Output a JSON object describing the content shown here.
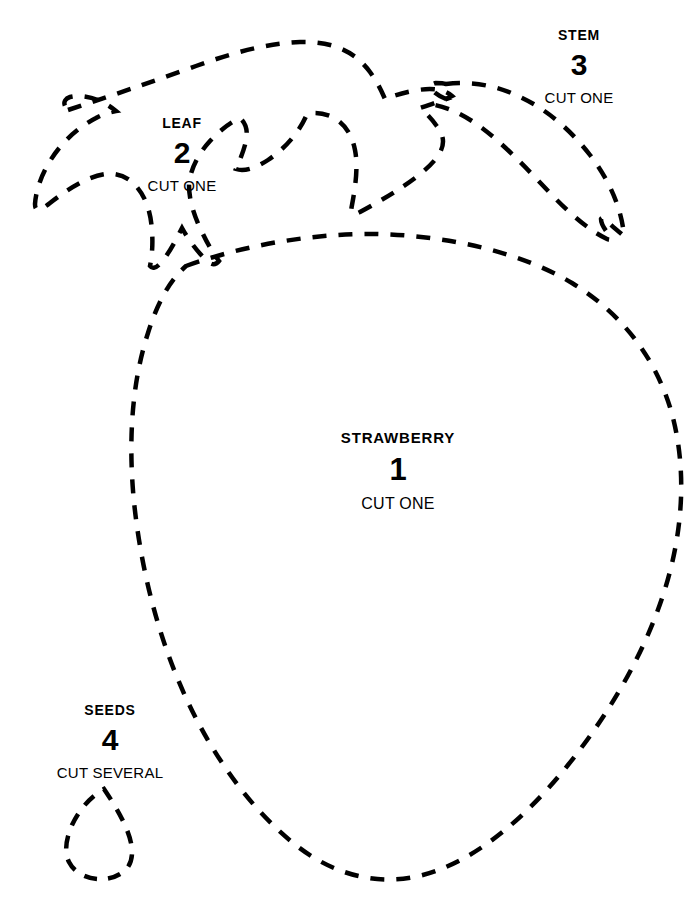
{
  "document": {
    "kind": "sewing-pattern-template",
    "background_color": "#ffffff",
    "ink_color": "#000000",
    "width": 698,
    "height": 901
  },
  "line_style": {
    "stroke_color": "#000000",
    "stroke_width": 4.5,
    "dash_length": 14,
    "gap_length": 12
  },
  "pieces": {
    "strawberry": {
      "name": "STRAWBERRY",
      "number": "1",
      "cut_instruction": "CUT ONE"
    },
    "leaf": {
      "name": "LEAF",
      "number": "2",
      "cut_instruction": "CUT ONE"
    },
    "stem": {
      "name": "STEM",
      "number": "3",
      "cut_instruction": "CUT ONE"
    },
    "seeds": {
      "name": "SEEDS",
      "number": "4",
      "cut_instruction": "CUT SEVERAL"
    }
  }
}
